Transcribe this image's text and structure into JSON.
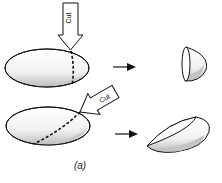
{
  "diagram": {
    "cut_label_top": "Cut",
    "cut_label_bottom": "Cut",
    "caption": "(a)",
    "colors": {
      "stroke": "#111111",
      "shade": "#c8c8c8",
      "fill": "#ffffff"
    }
  }
}
